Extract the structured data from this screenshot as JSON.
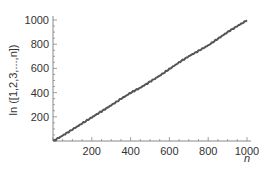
{
  "chart_data": {
    "type": "line",
    "title": "",
    "xlabel": "n",
    "ylabel": "ln ([1,2,3,...,n])",
    "xlim": [
      0,
      1000
    ],
    "ylim": [
      0,
      1000
    ],
    "xticks": [
      200,
      400,
      600,
      800,
      1000
    ],
    "yticks": [
      200,
      400,
      600,
      800,
      1000
    ],
    "grid": false,
    "legend": null,
    "series": [
      {
        "name": "ln(lcm(1..n))",
        "color": "#555555",
        "x": [
          1,
          50,
          100,
          150,
          200,
          250,
          300,
          350,
          400,
          450,
          500,
          550,
          600,
          650,
          700,
          750,
          800,
          850,
          900,
          950,
          1000
        ],
        "values": [
          0,
          45,
          95,
          145,
          195,
          245,
          295,
          348,
          398,
          440,
          490,
          540,
          595,
          650,
          700,
          745,
          790,
          845,
          900,
          950,
          997
        ]
      }
    ]
  },
  "axes": {
    "x_title": "n",
    "y_title": "ln ([1,2,3,...,n])",
    "x_tick_labels": [
      "200",
      "400",
      "600",
      "800",
      "1000"
    ],
    "y_tick_labels": [
      "200",
      "400",
      "600",
      "800",
      "1000"
    ]
  }
}
